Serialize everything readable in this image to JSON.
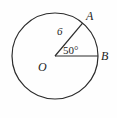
{
  "figure": {
    "type": "circle-central-angle-diagram",
    "background_color": "#fefefe",
    "stroke_color": "#2b2b2b",
    "text_color": "#1c1c1c",
    "labels": {
      "center": "O",
      "point_a": "A",
      "point_b": "B",
      "radius": "6",
      "angle": "50°"
    },
    "geometry": {
      "circle": {
        "cx": 55,
        "cy": 56,
        "r": 43
      },
      "center_point": {
        "x": 55,
        "y": 56
      },
      "point_a": {
        "x": 82.6,
        "y": 23.1
      },
      "point_b": {
        "x": 98,
        "y": 56
      },
      "angle_degrees": 50,
      "radius_value": 6
    }
  }
}
